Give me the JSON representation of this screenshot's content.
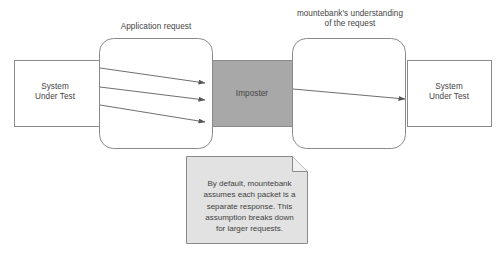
{
  "diagram": {
    "background_color": "#ffffff",
    "stroke_color": "#8a8a8a",
    "text_color": "#444444",
    "captions": {
      "application_request": "Application request",
      "mountebank_understanding": "mountebank's understanding\nof the request"
    },
    "nodes": {
      "system_under_test_left": {
        "label": "System\nUnder Test",
        "shape": "rectangle",
        "fill": "#ffffff"
      },
      "system_under_test_right": {
        "label": "System\nUnder Test",
        "shape": "rectangle",
        "fill": "#ffffff"
      },
      "imposter": {
        "label": "Imposter",
        "shape": "rectangle",
        "fill": "#a8a8a8"
      },
      "request_pipe_left": {
        "label": "",
        "shape": "rounded-rectangle",
        "fill": "#ffffff"
      },
      "request_pipe_right": {
        "label": "",
        "shape": "rounded-rectangle",
        "fill": "#ffffff"
      }
    },
    "arrows": {
      "incoming_packet_count": 3,
      "outgoing_request_count": 1
    },
    "note": {
      "text": "By default, mountebank\nassumes each packet is a\nseparate response. This\nassumption breaks down\nfor larger requests.",
      "fill": "#e2e2e2",
      "folded_corner": true
    }
  }
}
